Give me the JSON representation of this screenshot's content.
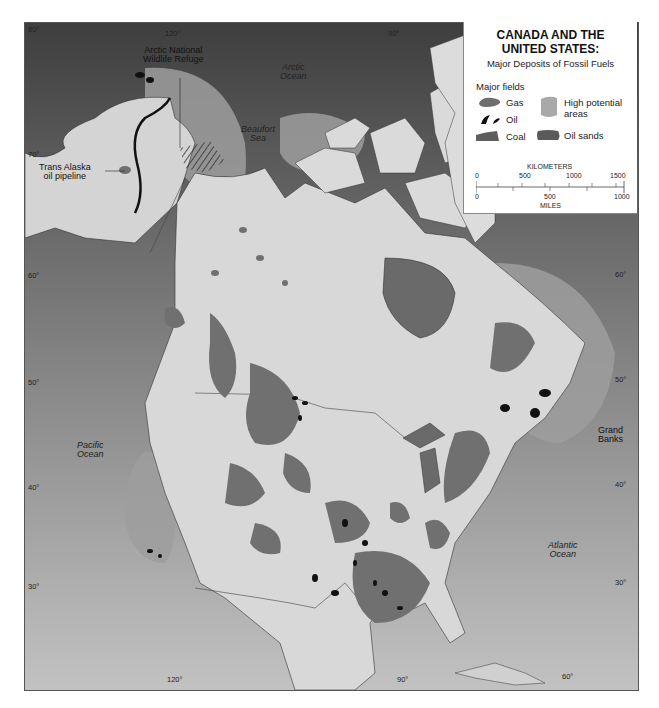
{
  "title": {
    "line1": "CANADA AND THE",
    "line2": "UNITED STATES:",
    "subtitle": "Major Deposits of Fossil Fuels"
  },
  "legend": {
    "heading": "Major fields",
    "items": [
      {
        "label": "Gas",
        "color": "#6e6e6e"
      },
      {
        "label": "Oil",
        "color": "#111111"
      },
      {
        "label": "Coal",
        "color": "#5e5e5e"
      },
      {
        "label": "High potential areas",
        "label_line1": "High potential",
        "label_line2": "areas",
        "color": "#a9a9a9"
      },
      {
        "label": "Oil sands",
        "color": "#5a5a5a"
      }
    ]
  },
  "scale_bar": {
    "km_label": "KILOMETERS",
    "km_ticks": [
      "0",
      "500",
      "1000",
      "1500"
    ],
    "mi_ticks": [
      "0",
      "500",
      "1000"
    ],
    "mi_label": "MILES"
  },
  "map_labels": {
    "oceans": [
      {
        "line1": "Arctic",
        "line2": "Ocean"
      },
      {
        "line1": "Beaufort",
        "line2": "Sea"
      },
      {
        "line1": "Pacific",
        "line2": "Ocean"
      },
      {
        "line1": "Atlantic",
        "line2": "Ocean"
      }
    ],
    "callouts": [
      {
        "line1": "Arctic National",
        "line2": "Wildlife Refuge"
      },
      {
        "line1": "Trans Alaska",
        "line2": "oil pipeline"
      },
      {
        "line1": "Grand",
        "line2": "Banks"
      }
    ]
  },
  "graticule": {
    "left_lat": [
      "80°",
      "70°",
      "60°",
      "50°",
      "40°",
      "30°"
    ],
    "right_lat": [
      "60°",
      "50°",
      "40°",
      "30°"
    ],
    "top_lon": [
      "120°",
      "90°"
    ],
    "bottom_lon": [
      "120°",
      "90°",
      "60°"
    ]
  },
  "colors": {
    "ocean_dark": "#4a4a4a",
    "ocean_mid": "#7d7d7d",
    "ocean_light": "#b8b8b8",
    "land": "#d6d6d6",
    "gas": "#6e6e6e",
    "oil": "#111111",
    "high_potential": "#a9a9a9"
  }
}
